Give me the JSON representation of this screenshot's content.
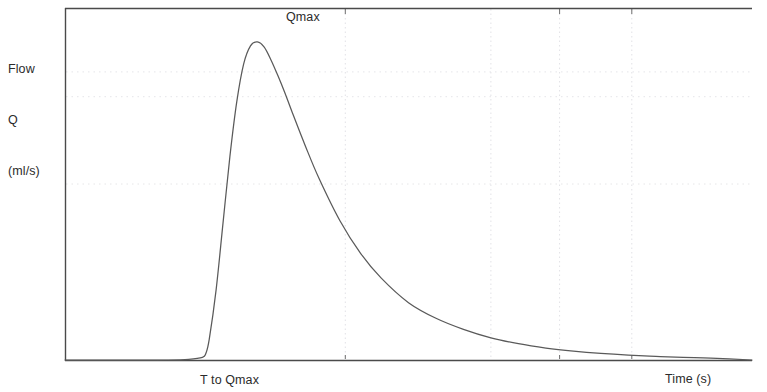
{
  "axes": {
    "y_axis_label_lines": [
      "Flow",
      "Q",
      "(ml/s)"
    ],
    "y_axis_label_line1": "Flow",
    "y_axis_label_line2": "Q",
    "y_axis_label_line3": "(ml/s)",
    "x_axis_label": "Time (s)"
  },
  "annotations": {
    "peak_label": "Qmax",
    "time_to_peak_label": "T to Qmax"
  },
  "colors": {
    "curve": "#5a5a5a",
    "frame": "#4a4a4a",
    "gridline": "#e2e2e6",
    "text": "#2b2b2b",
    "background": "#ffffff"
  },
  "chart_data": {
    "type": "line",
    "title": "",
    "subtitle": "",
    "xlabel": "Time (s)",
    "ylabel": "Flow Q (ml/s)",
    "grid": true,
    "legend": null,
    "annotations": [
      {
        "text": "Qmax",
        "x": 2.8,
        "y": 26.5,
        "description": "maximum flow rate, placed above the curve peak"
      },
      {
        "text": "T to Qmax",
        "x": 1.55,
        "y": -1.6,
        "description": "time to reach maximum flow, placed below the x-axis under the rising limb"
      }
    ],
    "xlim": [
      0,
      10
    ],
    "ylim": [
      0,
      27
    ],
    "x_gridlines": [
      4.08,
      6.2,
      7.2,
      8.25
    ],
    "y_gridlines": [
      22.1,
      20.2,
      13.5
    ],
    "x_tick_positions": [
      4.08,
      7.2,
      8.25
    ],
    "y_tick_labels": [],
    "x_tick_labels": [],
    "series": [
      {
        "name": "Urinary flow rate",
        "x": [
          0.0,
          0.5,
          1.0,
          1.5,
          1.8,
          2.0,
          2.05,
          2.1,
          2.2,
          2.3,
          2.4,
          2.5,
          2.6,
          2.7,
          2.8,
          2.9,
          3.0,
          3.1,
          3.2,
          3.3,
          3.5,
          3.7,
          4.0,
          4.3,
          4.6,
          5.0,
          5.4,
          5.8,
          6.2,
          6.6,
          7.0,
          7.4,
          7.8,
          8.2,
          8.6,
          9.0,
          9.4,
          10.0
        ],
        "y": [
          0.0,
          0.0,
          0.0,
          0.0,
          0.05,
          0.2,
          0.5,
          1.6,
          5.4,
          10.5,
          15.6,
          19.8,
          22.7,
          24.1,
          24.4,
          24.0,
          23.0,
          21.8,
          20.5,
          19.1,
          16.4,
          13.9,
          10.7,
          8.2,
          6.3,
          4.4,
          3.2,
          2.35,
          1.7,
          1.25,
          0.92,
          0.68,
          0.5,
          0.37,
          0.28,
          0.2,
          0.15,
          0.0
        ]
      }
    ],
    "peak": {
      "x": 2.8,
      "y": 24.4
    },
    "baseline_start_x": 2.0,
    "baseline_return_x": 9.4
  }
}
